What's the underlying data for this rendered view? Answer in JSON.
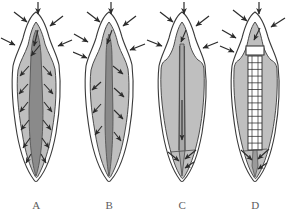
{
  "figure": {
    "background_color": "#ffffff",
    "width": 293,
    "height": 217,
    "panel_count": 4
  },
  "colors": {
    "outline": "#3a3a3a",
    "enamel_fill": "#ffffff",
    "dentin_fill": "#bfbfbf",
    "dentin_fill_light": "#c9c9c9",
    "pulp_fill": "#8a8a8a",
    "pulp_fill_dark": "#777777",
    "post_fill": "#ffffff",
    "arrow_color": "#2b2b2b",
    "label_color": "#5d5d5d",
    "background": "#ffffff"
  },
  "panels": [
    {
      "id": "a",
      "label": "A",
      "caption": "Intact tooth with wide pulp canal; stress radiates obliquely outward through dentin",
      "canal_width": "wide",
      "internal_arrow_pairs": 6,
      "has_post": false,
      "apex_arrows": 0,
      "external_arrows": 5
    },
    {
      "id": "b",
      "label": "B",
      "caption": "Tooth with narrowed canal; fewer oblique stress vectors in coronal dentin",
      "canal_width": "narrow",
      "internal_arrow_pairs": 4,
      "has_post": false,
      "apex_arrows": 0,
      "external_arrows": 5
    },
    {
      "id": "c",
      "label": "C",
      "caption": "Endodontically treated tooth; stress channelled axially toward the apex",
      "canal_width": "thin-parallel",
      "internal_arrow_pairs": 0,
      "has_post": false,
      "apex_arrows": 3,
      "external_arrows": 5
    },
    {
      "id": "d",
      "label": "D",
      "caption": "Tooth restored with threaded post; stress transferred along post to apex",
      "canal_width": "post-filled",
      "internal_arrow_pairs": 0,
      "has_post": true,
      "post_thread_segments": 14,
      "apex_arrows": 3,
      "external_arrows": 5
    }
  ],
  "external_arrow_set": {
    "description": "Occlusal and lateral loading vectors applied to the crown",
    "arrows": [
      {
        "name": "occlusal-vertical",
        "direction": "down",
        "position": "crown-top-center"
      },
      {
        "name": "oblique-upper-left",
        "direction": "down-right",
        "position": "crown-upper-left"
      },
      {
        "name": "oblique-upper-right",
        "direction": "down-left",
        "position": "crown-upper-right"
      },
      {
        "name": "lateral-left",
        "direction": "down-right",
        "position": "crown-cervical-left"
      },
      {
        "name": "lateral-right",
        "direction": "down-left",
        "position": "crown-cervical-right"
      }
    ]
  }
}
